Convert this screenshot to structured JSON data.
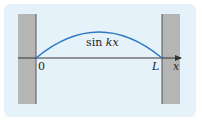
{
  "diagram": {
    "curve_label": "sin",
    "curve_label_var": "kx",
    "origin_label": "0",
    "end_label": "L",
    "axis_label": "x",
    "colors": {
      "background": "#e6f2fa",
      "wall": "#b5b5b5",
      "wall_edge": "#555555",
      "curve": "#2f78c4",
      "axis": "#333333"
    }
  }
}
